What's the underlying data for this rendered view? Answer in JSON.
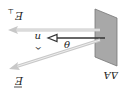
{
  "diagram": {
    "orientation": "rotated 180 degrees",
    "labels": {
      "area": "ΔA",
      "field": "E",
      "field_perp": "E",
      "field_perp_sub": "⊥",
      "normal": "n",
      "angle": "θ"
    },
    "colors": {
      "plate": "#a8a8a8",
      "plate_edge": "#777777",
      "field_arrow": "#c8c8c8",
      "normal_arrow": "#333333",
      "text": "#222222"
    }
  }
}
